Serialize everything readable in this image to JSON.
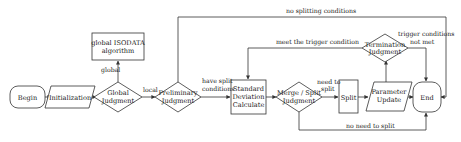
{
  "diagram": {
    "type": "flowchart",
    "nodes": {
      "begin": {
        "label": "Begin",
        "shape": "rounded-rect"
      },
      "initialization": {
        "label": "Initialization",
        "shape": "parallelogram"
      },
      "global_judgment": {
        "line1": "Global",
        "line2": "Judgment",
        "shape": "diamond"
      },
      "global_isodata": {
        "line1": "global ISODATA",
        "line2": "algorithm",
        "shape": "rect"
      },
      "preliminary_judgment": {
        "line1": "Preliminary",
        "line2": "Judgment",
        "shape": "diamond"
      },
      "std_dev": {
        "line1": "Standard",
        "line2": "Deviation",
        "line3": "Calculate",
        "shape": "rect"
      },
      "merge_split": {
        "line1": "Merge / Split",
        "line2": "Judgment",
        "shape": "diamond"
      },
      "split": {
        "label": "Split",
        "shape": "rect"
      },
      "parameter_update": {
        "line1": "Parameter",
        "line2": "Update",
        "shape": "parallelogram"
      },
      "end": {
        "label": "End",
        "shape": "rounded-rect"
      },
      "termination_judgment": {
        "line1": "Termination",
        "line2": "Judgment",
        "shape": "diamond"
      }
    },
    "edge_labels": {
      "global": "global",
      "local": "local",
      "have_split_1": "have split",
      "have_split_2": "conditions",
      "no_splitting": "no splitting conditions",
      "meet_trigger": "meet the trigger condition",
      "trigger_not_met_1": "trigger conditions",
      "trigger_not_met_2": "not met",
      "need_split_1": "need to",
      "need_split_2": "split",
      "no_need_split": "no need to split"
    },
    "colors": {
      "stroke": "#333333",
      "background": "#ffffff",
      "text": "#222222"
    }
  }
}
